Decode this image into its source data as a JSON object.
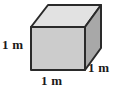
{
  "figure": {
    "type": "geometric-solid",
    "shape_name": "cube",
    "background_color": "#ffffff",
    "outline_color": "#2a2a2a",
    "outline_width": 2,
    "faces": {
      "front": {
        "name": "front-face",
        "fill": "#cccccc",
        "points": "31,27 85,27 85,70 31,70"
      },
      "top": {
        "name": "top-face",
        "fill": "#e2e2e2",
        "points": "31,27 48,5 101,5 85,27"
      },
      "right": {
        "name": "right-face",
        "fill": "#a8a8a8",
        "points": "85,27 101,5 101,48 85,70"
      }
    },
    "labels": {
      "height": "1 m",
      "width": "1 m",
      "depth": "1 m"
    }
  }
}
